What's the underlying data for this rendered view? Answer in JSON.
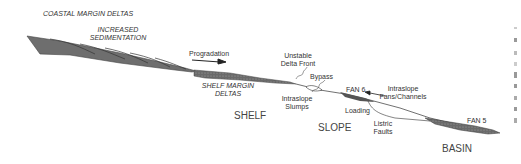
{
  "title": "COASTAL MARGIN DELTAS",
  "labels": {
    "increased_sedimentation": [
      "INCREASED",
      "SEDIMENTATION"
    ],
    "progradation": "Progradation",
    "shelf_margin_deltas": [
      "SHELF MARGIN",
      "DELTAS"
    ],
    "unstable_delta_front": [
      "Unstable",
      "Delta Front"
    ],
    "bypass": "Bypass",
    "intraslope_slumps": [
      "Intraslope",
      "Slumps"
    ],
    "fan6": "FAN 6",
    "intraslope_fans_channels": [
      "Intraslope",
      "Fans/Channels"
    ],
    "loading": "Loading",
    "listric_faults": [
      "Listric",
      "Faults"
    ],
    "fan5": "FAN 5",
    "shelf": "SHELF",
    "slope": "SLOPE",
    "basin": "BASIN"
  },
  "colors": {
    "fill_dark": "#6e6e6e",
    "fill_stipple": "#7a7a7a",
    "line": "#333333",
    "text": "#333333"
  }
}
